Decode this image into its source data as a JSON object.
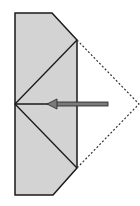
{
  "diagram": {
    "type": "origami-fold-step",
    "description": "Fold the right triangular flap inward along the valley line toward the left center point",
    "colors": {
      "paper_fill": "#d3d3d3",
      "outline": "#1a1a1a",
      "dotted_outline": "#333333",
      "arrow_fill": "#7a7a7a",
      "arrow_stroke": "#222222",
      "background": "#ffffff"
    },
    "shape": {
      "polygon": [
        [
          15,
          13
        ],
        [
          52,
          13
        ],
        [
          77,
          40
        ],
        [
          77,
          168
        ],
        [
          53,
          195
        ],
        [
          15,
          195
        ]
      ]
    },
    "crease_lines": [
      {
        "from": [
          15,
          104
        ],
        "to": [
          77,
          40
        ]
      },
      {
        "from": [
          15,
          104
        ],
        "to": [
          77,
          168
        ]
      },
      {
        "from": [
          15,
          104
        ],
        "to": [
          48,
          104
        ]
      }
    ],
    "dotted_flap": {
      "points": [
        [
          77,
          40
        ],
        [
          139,
          104
        ],
        [
          77,
          168
        ]
      ]
    },
    "arrow": {
      "direction": "left",
      "tail": [
        108,
        104
      ],
      "tip": [
        47,
        104
      ]
    }
  }
}
